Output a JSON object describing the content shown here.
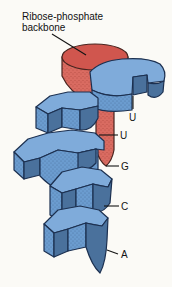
{
  "canvas": {
    "width": 172,
    "height": 287,
    "background": "#fbfaf6"
  },
  "title": {
    "line1": "Ribose-phosphate",
    "line2": "backbone"
  },
  "bases": [
    {
      "id": "u1",
      "label": "U"
    },
    {
      "id": "u2",
      "label": "U"
    },
    {
      "id": "g",
      "label": "G"
    },
    {
      "id": "c",
      "label": "C"
    },
    {
      "id": "a",
      "label": "A"
    }
  ],
  "colors": {
    "backbone_red": "#d0564e",
    "backbone_red_body": "#d96b61",
    "base_top_blue": "#7fabda",
    "base_front_blue": "#6b9ccf",
    "base_side_blue": "#4a719c",
    "outline_blue": "#1c3050",
    "outline_red": "#48241f",
    "text": "#141414",
    "background": "#fbfaf6"
  }
}
